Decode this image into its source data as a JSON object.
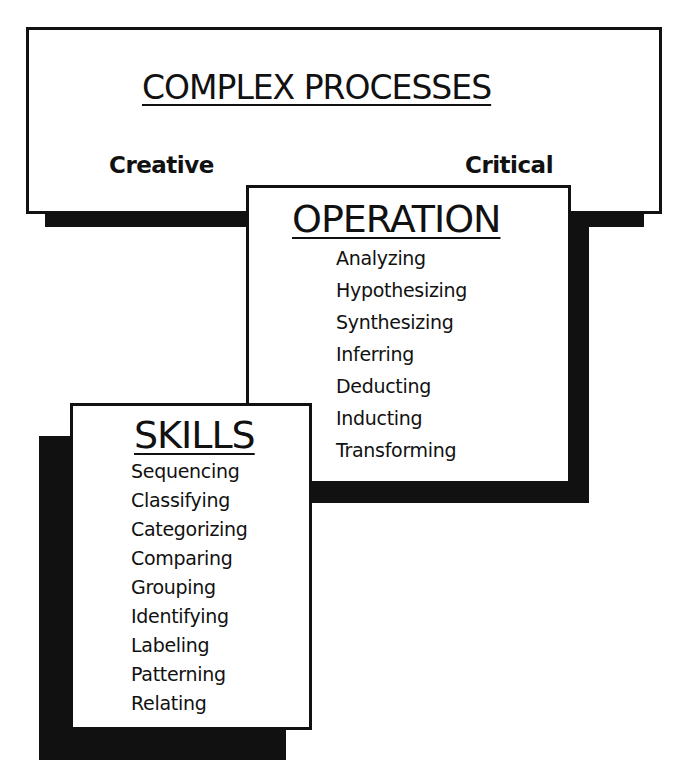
{
  "diagram": {
    "top_box": {
      "title": "COMPLEX PROCESSES",
      "left_label": "Creative",
      "right_label": "Critical"
    },
    "operation_box": {
      "title": "OPERATION",
      "items": [
        "Analyzing",
        "Hypothesizing",
        "Synthesizing",
        "Inferring",
        "Deducting",
        "Inducting",
        "Transforming"
      ]
    },
    "skills_box": {
      "title": "SKILLS",
      "items": [
        "Sequencing",
        "Classifying",
        "Categorizing",
        "Comparing",
        "Grouping",
        "Identifying",
        "Labeling",
        "Patterning",
        "Relating"
      ]
    },
    "colors": {
      "ink": "#111111",
      "background": "#ffffff"
    }
  }
}
